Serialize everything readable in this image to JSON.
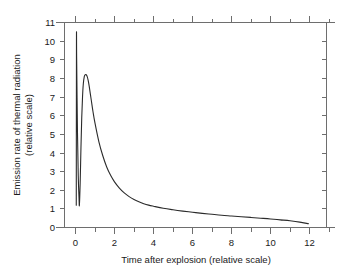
{
  "chart_data": {
    "type": "line",
    "title": "",
    "xlabel": "Time after explosion (relative scale)",
    "ylabel_line1": "Emission rate of thermal radiation",
    "ylabel_line2": "(relative scale)",
    "xlim": [
      -0.55,
      13.0
    ],
    "ylim": [
      0,
      11
    ],
    "grid": false,
    "legend": null,
    "line_color": "#2b2b2b",
    "axis_color": "#6e6e6e",
    "background_color": "#ffffff",
    "xticks": [
      0,
      2,
      4,
      6,
      8,
      10,
      12
    ],
    "xtick_labels": [
      "0",
      "2",
      "4",
      "6",
      "8",
      "10",
      "12"
    ],
    "xminor_ticks": [
      1,
      3,
      5,
      7,
      9,
      11,
      13
    ],
    "yticks": [
      0,
      1,
      2,
      3,
      4,
      5,
      6,
      7,
      8,
      9,
      10,
      11
    ],
    "ytick_labels": [
      "0",
      "1",
      "2",
      "3",
      "4",
      "5",
      "6",
      "7",
      "8",
      "9",
      "10",
      "11"
    ],
    "annotations": [],
    "series": [
      {
        "name": "Thermal radiation emission rate",
        "description": "Double-pulse thermal emission: narrow first maximum, minimum, broad second maximum, long decay tail",
        "first_pulse": {
          "peak_time": 0.05,
          "peak_value": 10.0,
          "minimum_time": 0.2,
          "minimum_value": 1.2
        },
        "second_pulse": {
          "peak_time": 0.52,
          "peak_value": 8.2
        },
        "tail_end": {
          "time": 11.95,
          "value": 0.2
        },
        "x": [
          0.04,
          0.05,
          0.06,
          0.1,
          0.14,
          0.18,
          0.2,
          0.24,
          0.28,
          0.32,
          0.36,
          0.4,
          0.45,
          0.5,
          0.55,
          0.6,
          0.65,
          0.7,
          0.8,
          0.9,
          1.0,
          1.2,
          1.4,
          1.6,
          1.8,
          2.0,
          2.25,
          2.5,
          2.75,
          3.0,
          3.25,
          3.5,
          3.75,
          4.0,
          4.5,
          5.0,
          5.5,
          6.0,
          6.5,
          7.0,
          7.5,
          8.0,
          8.5,
          9.0,
          9.5,
          10.0,
          10.5,
          11.0,
          11.5,
          11.95
        ],
        "y": [
          1.2,
          10.0,
          9.0,
          5.2,
          2.8,
          1.6,
          1.2,
          2.4,
          4.3,
          5.9,
          7.0,
          7.7,
          8.1,
          8.2,
          8.2,
          8.1,
          7.9,
          7.6,
          6.9,
          6.2,
          5.6,
          4.6,
          3.85,
          3.25,
          2.8,
          2.45,
          2.12,
          1.86,
          1.66,
          1.5,
          1.38,
          1.28,
          1.2,
          1.14,
          1.03,
          0.95,
          0.88,
          0.82,
          0.76,
          0.71,
          0.66,
          0.62,
          0.58,
          0.54,
          0.5,
          0.46,
          0.41,
          0.36,
          0.29,
          0.2
        ]
      }
    ]
  }
}
